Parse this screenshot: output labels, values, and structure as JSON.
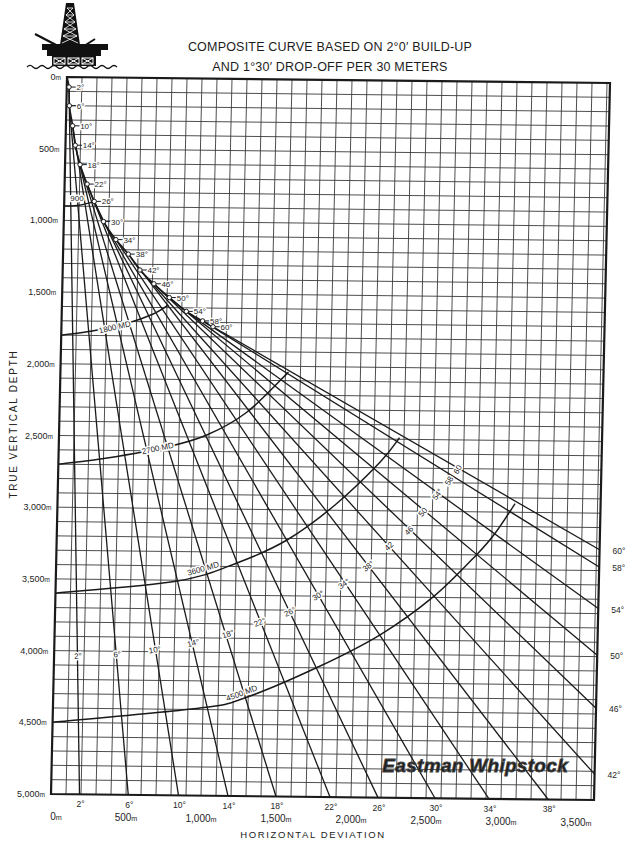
{
  "header": {
    "title_line1": "COMPOSITE CURVE BASED ON 2°0′ BUILD-UP",
    "title_line2": "AND 1°30′ DROP-OFF PER 30 METERS"
  },
  "logo": {
    "icon": "offshore-oil-rig-icon"
  },
  "watermark": "Eastman Whipstock",
  "colors": {
    "ink": "#1a1a1a",
    "grid": "#3a3a3a",
    "background": "#ffffff"
  },
  "chart_data": {
    "type": "line",
    "title": "COMPOSITE CURVE BASED ON 2°0′ BUILD-UP AND 1°30′ DROP-OFF PER 30 METERS",
    "xlabel": "HORIZONTAL DEVIATION",
    "ylabel": "TRUE VERTICAL DEPTH",
    "units": "m",
    "xlim": [
      0,
      3620
    ],
    "ylim": [
      5000,
      0
    ],
    "y_inverted": true,
    "grid": {
      "on": true,
      "x_step": 100,
      "y_step": 100
    },
    "legend": "none",
    "x_ticks": [
      {
        "value": 0,
        "label": "0m"
      },
      {
        "value": 500,
        "label": "500m"
      },
      {
        "value": 1000,
        "label": "1,000m"
      },
      {
        "value": 1500,
        "label": "1,500m"
      },
      {
        "value": 2000,
        "label": "2,000m"
      },
      {
        "value": 2500,
        "label": "2,500m"
      },
      {
        "value": 3000,
        "label": "3,000m"
      },
      {
        "value": 3500,
        "label": "3,500m"
      }
    ],
    "y_ticks": [
      {
        "value": 0,
        "label": "0m"
      },
      {
        "value": 500,
        "label": "500m"
      },
      {
        "value": 1000,
        "label": "1,000m"
      },
      {
        "value": 1500,
        "label": "1,500m"
      },
      {
        "value": 2000,
        "label": "2,000m"
      },
      {
        "value": 2500,
        "label": "2,500m"
      },
      {
        "value": 3000,
        "label": "3,000m"
      },
      {
        "value": 3500,
        "label": "3,500m"
      },
      {
        "value": 4000,
        "label": "4,000m"
      },
      {
        "value": 4500,
        "label": "4,500m"
      },
      {
        "value": 5000,
        "label": "5,000m"
      }
    ],
    "build_curve": [
      {
        "label": "2°",
        "hd": 15,
        "tvd": 70
      },
      {
        "label": "6°",
        "hd": 20,
        "tvd": 200
      },
      {
        "label": "10°",
        "hd": 45,
        "tvd": 340
      },
      {
        "label": "14°",
        "hd": 65,
        "tvd": 475
      },
      {
        "label": "18°",
        "hd": 100,
        "tvd": 610
      },
      {
        "label": "22°",
        "hd": 150,
        "tvd": 745
      },
      {
        "label": "26°",
        "hd": 200,
        "tvd": 865
      },
      {
        "label": "30°",
        "hd": 265,
        "tvd": 1005
      },
      {
        "label": "34°",
        "hd": 350,
        "tvd": 1130
      },
      {
        "label": "38°",
        "hd": 435,
        "tvd": 1230
      },
      {
        "label": "42°",
        "hd": 515,
        "tvd": 1340
      },
      {
        "label": "46°",
        "hd": 610,
        "tvd": 1435
      },
      {
        "label": "50°",
        "hd": 715,
        "tvd": 1530
      },
      {
        "label": "54°",
        "hd": 830,
        "tvd": 1625
      },
      {
        "label": "58°",
        "hd": 940,
        "tvd": 1690
      },
      {
        "label": "60°",
        "hd": 1010,
        "tvd": 1730
      }
    ],
    "series": [
      {
        "name": "2°",
        "angle": 2,
        "start": [
          15,
          70
        ],
        "end": [
          190,
          5000
        ],
        "end_label": "bottom",
        "inline_label": "2°",
        "label_at": [
          160,
          4035
        ]
      },
      {
        "name": "6°",
        "angle": 6,
        "start": [
          20,
          200
        ],
        "end": [
          515,
          5000
        ],
        "end_label": "bottom",
        "inline_label": "6°",
        "label_at": [
          420,
          4020
        ]
      },
      {
        "name": "10°",
        "angle": 10,
        "start": [
          45,
          340
        ],
        "end": [
          850,
          5000
        ],
        "end_label": "bottom",
        "inline_label": "10°",
        "label_at": [
          670,
          3985
        ]
      },
      {
        "name": "14°",
        "angle": 14,
        "start": [
          65,
          475
        ],
        "end": [
          1180,
          5000
        ],
        "end_label": "bottom",
        "inline_label": "14°",
        "label_at": [
          925,
          3935
        ]
      },
      {
        "name": "18°",
        "angle": 18,
        "start": [
          100,
          610
        ],
        "end": [
          1500,
          5000
        ],
        "end_label": "bottom",
        "inline_label": "18°",
        "label_at": [
          1155,
          3870
        ]
      },
      {
        "name": "22°",
        "angle": 22,
        "start": [
          150,
          745
        ],
        "end": [
          1860,
          5000
        ],
        "end_label": "bottom",
        "inline_label": "22°",
        "label_at": [
          1365,
          3785
        ]
      },
      {
        "name": "26°",
        "angle": 26,
        "start": [
          200,
          865
        ],
        "end": [
          2180,
          5000
        ],
        "end_label": "bottom",
        "inline_label": "26°",
        "label_at": [
          1565,
          3710
        ]
      },
      {
        "name": "30°",
        "angle": 30,
        "start": [
          265,
          1005
        ],
        "end": [
          2560,
          5000
        ],
        "end_label": "bottom",
        "inline_label": "30°",
        "label_at": [
          1750,
          3595
        ]
      },
      {
        "name": "34°",
        "angle": 34,
        "start": [
          350,
          1130
        ],
        "end": [
          2920,
          5000
        ],
        "end_label": "bottom",
        "inline_label": "34°",
        "label_at": [
          1920,
          3510
        ]
      },
      {
        "name": "38°",
        "angle": 38,
        "start": [
          435,
          1230
        ],
        "end": [
          3315,
          5000
        ],
        "end_label": "bottom",
        "inline_label": "38°",
        "label_at": [
          2080,
          3385
        ]
      },
      {
        "name": "42°",
        "angle": 42,
        "start": [
          515,
          1340
        ],
        "end": [
          3620,
          4820
        ],
        "end_label": "right",
        "inline_label": "42",
        "label_at": [
          2215,
          3245
        ]
      },
      {
        "name": "46°",
        "angle": 46,
        "start": [
          610,
          1435
        ],
        "end": [
          3620,
          4360
        ],
        "end_label": "right",
        "inline_label": "46",
        "label_at": [
          2345,
          3135
        ]
      },
      {
        "name": "50°",
        "angle": 50,
        "start": [
          715,
          1530
        ],
        "end": [
          3620,
          3990
        ],
        "end_label": "right",
        "inline_label": "50",
        "label_at": [
          2435,
          3005
        ]
      },
      {
        "name": "54°",
        "angle": 54,
        "start": [
          830,
          1625
        ],
        "end": [
          3620,
          3665
        ],
        "end_label": "right",
        "inline_label": "54°",
        "label_at": [
          2530,
          2880
        ]
      },
      {
        "name": "58°",
        "angle": 58,
        "start": [
          940,
          1690
        ],
        "end": [
          3620,
          3375
        ],
        "end_label": "right",
        "inline_label": "58",
        "label_at": [
          2605,
          2785
        ]
      },
      {
        "name": "60°",
        "angle": 60,
        "start": [
          1010,
          1730
        ],
        "end": [
          3620,
          3255
        ],
        "end_label": "right",
        "inline_label": "60",
        "label_at": [
          2660,
          2705
        ]
      }
    ],
    "md_curves": [
      {
        "label": "900",
        "points": [
          [
            0,
            900
          ],
          [
            100,
            893
          ],
          [
            200,
            867
          ]
        ],
        "label_at": [
          85,
          845
        ],
        "rotation": 0
      },
      {
        "label": "1800 MD",
        "points": [
          [
            0,
            1800
          ],
          [
            215,
            1767
          ],
          [
            435,
            1713
          ],
          [
            610,
            1646
          ],
          [
            710,
            1582
          ]
        ],
        "label_at": [
          355,
          1738
        ],
        "rotation": -13
      },
      {
        "label": "2700 MD",
        "points": [
          [
            0,
            2700
          ],
          [
            325,
            2653
          ],
          [
            720,
            2572
          ],
          [
            985,
            2485
          ],
          [
            1250,
            2322
          ],
          [
            1520,
            2040
          ]
        ],
        "label_at": [
          660,
          2580
        ],
        "rotation": -12
      },
      {
        "label": "3600 MD",
        "points": [
          [
            0,
            3600
          ],
          [
            810,
            3505
          ],
          [
            1205,
            3375
          ],
          [
            1535,
            3211
          ],
          [
            1850,
            2963
          ],
          [
            2145,
            2660
          ],
          [
            2270,
            2490
          ]
        ],
        "label_at": [
          980,
          3415
        ],
        "rotation": -16
      },
      {
        "label": "4500 MD",
        "points": [
          [
            0,
            4500
          ],
          [
            980,
            4390
          ],
          [
            1290,
            4310
          ],
          [
            1750,
            4100
          ],
          [
            2170,
            3865
          ],
          [
            2520,
            3595
          ],
          [
            2800,
            3300
          ],
          [
            2920,
            3150
          ],
          [
            3050,
            2940
          ]
        ],
        "label_at": [
          1255,
          4280
        ],
        "rotation": -20
      }
    ]
  }
}
